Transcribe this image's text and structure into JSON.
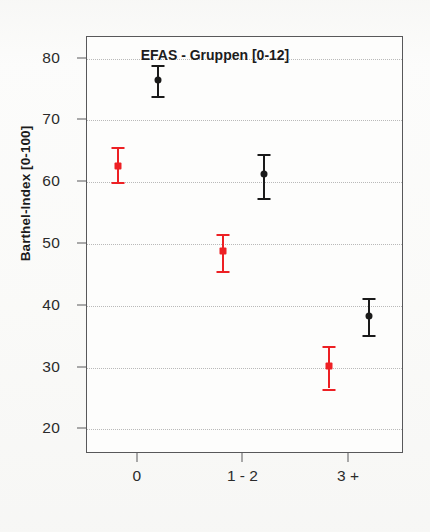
{
  "figure": {
    "background_color": "#fbfbfa",
    "frame_color": "#58585a",
    "gridline_color": "#b9b9b9"
  },
  "chart_data": {
    "type": "scatter",
    "title": "",
    "xlabel": "EFAS - Gruppen [0-12]",
    "ylabel": "Barthel-Index [0-100]",
    "categories": [
      "0",
      "1 - 2",
      "3 +"
    ],
    "xtick_labels": [
      "0",
      "1 - 2",
      "3 +"
    ],
    "ytick_labels": [
      "20",
      "30",
      "40",
      "50",
      "60",
      "70",
      "80"
    ],
    "yticks": [
      20,
      30,
      40,
      50,
      60,
      70,
      80
    ],
    "ylim": [
      16,
      83.5
    ],
    "xlim": [
      -0.48,
      2.52
    ],
    "grid": "horizontal-dotted",
    "legend": "none",
    "error_type": "95% confidence interval",
    "series": [
      {
        "name": "red-series",
        "color": "#ED2024",
        "marker": "square",
        "x_offset": -0.19,
        "points": [
          {
            "category": "0",
            "x": 0,
            "value": 62.6,
            "low": 60.0,
            "high": 65.7
          },
          {
            "category": "1 - 2",
            "x": 1,
            "value": 48.8,
            "low": 45.7,
            "high": 51.7
          },
          {
            "category": "3 +",
            "x": 2,
            "value": 30.3,
            "low": 26.6,
            "high": 33.5
          }
        ]
      },
      {
        "name": "black-series",
        "color": "#1A1A1A",
        "marker": "circle",
        "x_offset": 0.19,
        "points": [
          {
            "category": "0",
            "x": 0,
            "value": 76.6,
            "low": 73.9,
            "high": 79.0
          },
          {
            "category": "1 - 2",
            "x": 1,
            "value": 61.3,
            "low": 57.5,
            "high": 64.6
          },
          {
            "category": "3 +",
            "x": 2,
            "value": 38.3,
            "low": 35.3,
            "high": 41.2
          }
        ]
      }
    ]
  }
}
